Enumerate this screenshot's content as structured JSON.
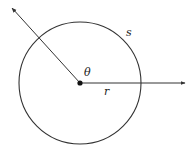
{
  "diagram": {
    "labels": {
      "theta": "θ",
      "r": "r",
      "s": "s"
    },
    "colors": {
      "stroke": "#333333",
      "background": "#ffffff"
    },
    "circle": {
      "cx": 80,
      "cy": 83,
      "radius": 61
    },
    "rays": [
      {
        "name": "radius-ray-horizontal",
        "from": [
          80,
          83
        ],
        "to": [
          186,
          83
        ]
      },
      {
        "name": "radius-ray-diagonal",
        "from": [
          80,
          83
        ],
        "to": [
          11,
          7
        ]
      }
    ]
  }
}
